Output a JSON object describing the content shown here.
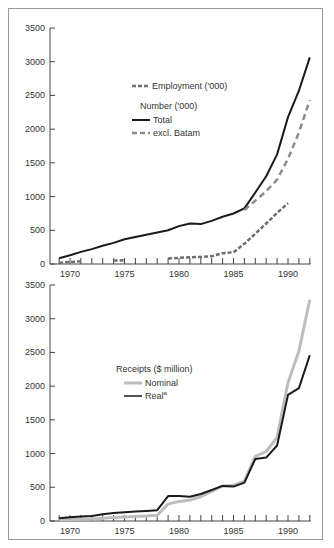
{
  "chart_data": [
    {
      "type": "line",
      "title": "",
      "xlabel": "",
      "ylabel": "",
      "xlim": [
        1969,
        1992
      ],
      "ylim": [
        0,
        3500
      ],
      "yticks": [
        0,
        500,
        1000,
        1500,
        2000,
        2500,
        3000,
        3500
      ],
      "xticks": [
        1970,
        1975,
        1980,
        1985,
        1990
      ],
      "grid": false,
      "legend": {
        "position": "upper-middle",
        "entries": [
          {
            "label": "Employment ('000)",
            "style": "dotted-dark-gray"
          },
          {
            "heading": "Number ('000)"
          },
          {
            "label": "Total",
            "style": "solid-black"
          },
          {
            "label": "excl. Batam",
            "style": "dashed-gray"
          }
        ]
      },
      "series": [
        {
          "name": "Total",
          "style": "solid-black",
          "x": [
            1969,
            1970,
            1971,
            1972,
            1973,
            1974,
            1975,
            1976,
            1977,
            1978,
            1979,
            1980,
            1981,
            1982,
            1983,
            1984,
            1985,
            1986,
            1987,
            1988,
            1989,
            1990,
            1991,
            1992
          ],
          "values": [
            86,
            129,
            179,
            221,
            270,
            313,
            366,
            401,
            433,
            468,
            501,
            562,
            600,
            592,
            639,
            701,
            749,
            825,
            1060,
            1301,
            1626,
            2178,
            2570,
            3064
          ]
        },
        {
          "name": "excl. Batam",
          "style": "dashed-gray",
          "x": [
            1986,
            1987,
            1988,
            1989,
            1990,
            1991,
            1992
          ],
          "values": [
            800,
            940,
            1080,
            1250,
            1560,
            1950,
            2430
          ]
        },
        {
          "name": "Employment ('000)",
          "style": "dotted-dark-gray",
          "segments": [
            {
              "x": [
                1969,
                1970,
                1971
              ],
              "values": [
                20,
                30,
                40
              ]
            },
            {
              "x": [
                1974,
                1975
              ],
              "values": [
                50,
                55
              ]
            },
            {
              "x": [
                1979,
                1980,
                1981,
                1982,
                1983,
                1984,
                1985,
                1986,
                1987,
                1988,
                1989,
                1990
              ],
              "values": [
                80,
                90,
                100,
                105,
                115,
                160,
                175,
                300,
                450,
                600,
                760,
                900
              ]
            }
          ]
        }
      ]
    },
    {
      "type": "line",
      "title": "",
      "xlabel": "",
      "ylabel": "",
      "xlim": [
        1969,
        1992
      ],
      "ylim": [
        0,
        3500
      ],
      "yticks": [
        0,
        500,
        1000,
        1500,
        2000,
        2500,
        3000,
        3500
      ],
      "xticks": [
        1970,
        1975,
        1980,
        1985,
        1990
      ],
      "grid": false,
      "legend": {
        "position": "middle",
        "heading": "Receipts ($ million)",
        "entries": [
          {
            "label": "Nominal",
            "style": "solid-light-gray-thick"
          },
          {
            "label": "Real",
            "superscript": "a",
            "style": "solid-black"
          }
        ]
      },
      "series": [
        {
          "name": "Nominal",
          "style": "solid-light-gray-thick",
          "x": [
            1969,
            1970,
            1971,
            1972,
            1973,
            1974,
            1975,
            1976,
            1977,
            1978,
            1979,
            1980,
            1981,
            1982,
            1983,
            1984,
            1985,
            1986,
            1987,
            1988,
            1989,
            1990,
            1991,
            1992
          ],
          "values": [
            20,
            22,
            25,
            30,
            40,
            52,
            60,
            65,
            75,
            85,
            250,
            290,
            310,
            360,
            440,
            520,
            530,
            590,
            960,
            1030,
            1240,
            2050,
            2520,
            3280
          ]
        },
        {
          "name": "Real",
          "style": "solid-black",
          "x": [
            1969,
            1970,
            1971,
            1972,
            1973,
            1974,
            1975,
            1976,
            1977,
            1978,
            1979,
            1980,
            1981,
            1982,
            1983,
            1984,
            1985,
            1986,
            1987,
            1988,
            1989,
            1990,
            1991,
            1992
          ],
          "values": [
            40,
            55,
            65,
            75,
            100,
            120,
            130,
            140,
            150,
            160,
            370,
            370,
            360,
            400,
            460,
            520,
            510,
            570,
            920,
            940,
            1120,
            1870,
            1970,
            2460
          ]
        }
      ]
    }
  ],
  "top_chart": {
    "legend_employment": "Employment ('000)",
    "legend_heading": "Number ('000)",
    "legend_total": "Total",
    "legend_excl": "excl. Batam"
  },
  "bottom_chart": {
    "legend_heading": "Receipts ($ million)",
    "legend_nominal": "Nominal",
    "legend_real": "Real",
    "legend_real_sup": "a"
  },
  "colors": {
    "black": "#1a1a1a",
    "dashed_gray": "#8c8c8c",
    "dotted_gray": "#6e6e6e",
    "nominal_gray": "#bdbdbd",
    "axis": "#444444",
    "frame": "#9a9a9a"
  }
}
